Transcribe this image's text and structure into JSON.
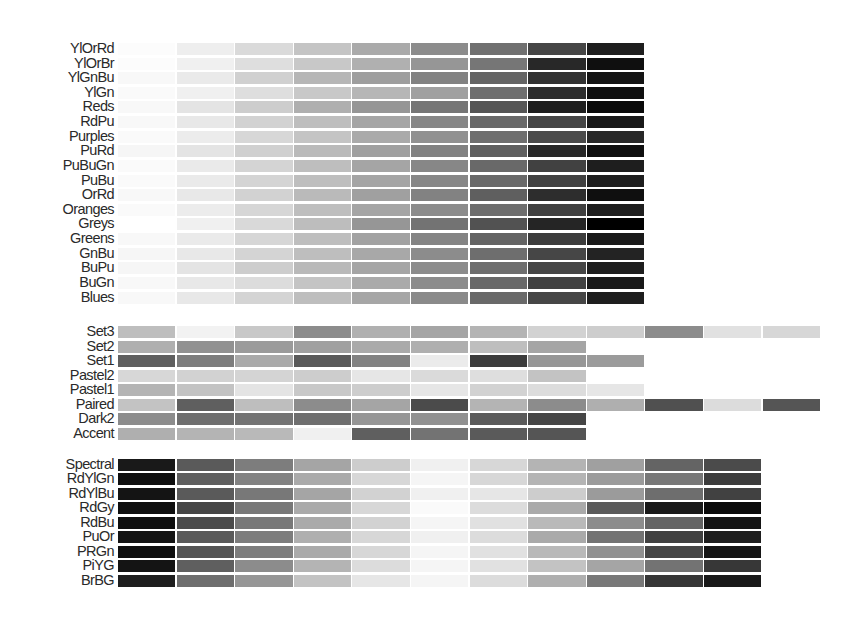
{
  "chart_data": {
    "type": "heatmap",
    "title": "",
    "grid": false,
    "groups": [
      {
        "name": "sequential",
        "n_colors": 9,
        "palettes": [
          {
            "name": "YlOrRd",
            "grays": [
              252,
              238,
              218,
              196,
              170,
              140,
              112,
              70,
              30
            ]
          },
          {
            "name": "YlOrBr",
            "grays": [
              252,
              240,
              222,
              200,
              176,
              150,
              118,
              40,
              15
            ]
          },
          {
            "name": "YlGnBu",
            "grays": [
              248,
              234,
              208,
              182,
              158,
              130,
              100,
              50,
              20
            ]
          },
          {
            "name": "YlGn",
            "grays": [
              250,
              240,
              222,
              200,
              182,
              160,
              110,
              45,
              15
            ]
          },
          {
            "name": "Reds",
            "grays": [
              248,
              228,
              205,
              175,
              150,
              118,
              85,
              30,
              10
            ]
          },
          {
            "name": "RdPu",
            "grays": [
              248,
              232,
              210,
              190,
              165,
              135,
              105,
              70,
              25
            ]
          },
          {
            "name": "Purples",
            "grays": [
              250,
              236,
              215,
              196,
              170,
              145,
              110,
              75,
              40
            ]
          },
          {
            "name": "PuRd",
            "grays": [
              246,
              228,
              208,
              186,
              160,
              130,
              95,
              40,
              15
            ]
          },
          {
            "name": "PuBuGn",
            "grays": [
              250,
              234,
              212,
              190,
              165,
              135,
              105,
              65,
              30
            ]
          },
          {
            "name": "PuBu",
            "grays": [
              250,
              234,
              212,
              190,
              165,
              135,
              105,
              65,
              30
            ]
          },
          {
            "name": "OrRd",
            "grays": [
              248,
              232,
              210,
              186,
              160,
              130,
              95,
              45,
              15
            ]
          },
          {
            "name": "Oranges",
            "grays": [
              250,
              236,
              214,
              190,
              165,
              140,
              110,
              65,
              30
            ]
          },
          {
            "name": "Greys",
            "grays": [
              255,
              240,
              217,
              189,
              150,
              115,
              82,
              37,
              0
            ]
          },
          {
            "name": "Greens",
            "grays": [
              248,
              234,
              214,
              190,
              162,
              132,
              100,
              60,
              25
            ]
          },
          {
            "name": "GnBu",
            "grays": [
              246,
              232,
              212,
              190,
              168,
              140,
              110,
              70,
              35
            ]
          },
          {
            "name": "BuPu",
            "grays": [
              246,
              228,
              205,
              185,
              165,
              140,
              110,
              70,
              30
            ]
          },
          {
            "name": "BuGn",
            "grays": [
              248,
              232,
              220,
              196,
              170,
              140,
              105,
              65,
              25
            ]
          },
          {
            "name": "Blues",
            "grays": [
              248,
              232,
              212,
              190,
              166,
              138,
              105,
              70,
              30
            ]
          }
        ]
      },
      {
        "name": "qualitative",
        "palettes": [
          {
            "name": "Set3",
            "grays": [
              190,
              242,
              200,
              140,
              176,
              165,
              180,
              210,
              205,
              140,
              225,
              215
            ]
          },
          {
            "name": "Set2",
            "grays": [
              175,
              145,
              155,
              160,
              170,
              175,
              190,
              165
            ]
          },
          {
            "name": "Set1",
            "grays": [
              95,
              125,
              170,
              90,
              130,
              235,
              60,
              150,
              155
            ]
          },
          {
            "name": "Pastel2",
            "grays": [
              215,
              210,
              212,
              205,
              230,
              218,
              222,
              195
            ]
          },
          {
            "name": "Pastel1",
            "grays": [
              180,
              195,
              228,
              200,
              205,
              230,
              210,
              220,
              230
            ]
          },
          {
            "name": "Paired",
            "grays": [
              195,
              95,
              190,
              140,
              165,
              75,
              180,
              140,
              175,
              80,
              220,
              85
            ]
          },
          {
            "name": "Dark2",
            "grays": [
              140,
              110,
              115,
              110,
              150,
              145,
              90,
              70
            ]
          },
          {
            "name": "Accent",
            "grays": [
              175,
              180,
              185,
              240,
              95,
              115,
              90,
              85
            ]
          }
        ]
      },
      {
        "name": "diverging",
        "n_colors": 11,
        "palettes": [
          {
            "name": "Spectral",
            "grays": [
              25,
              90,
              125,
              165,
              205,
              240,
              215,
              180,
              160,
              100,
              75
            ]
          },
          {
            "name": "RdYlGn",
            "grays": [
              15,
              95,
              130,
              170,
              215,
              245,
              215,
              180,
              155,
              120,
              60
            ]
          },
          {
            "name": "RdYlBu",
            "grays": [
              20,
              90,
              120,
              165,
              210,
              240,
              230,
              205,
              155,
              110,
              65
            ]
          },
          {
            "name": "RdGy",
            "grays": [
              15,
              70,
              120,
              170,
              215,
              250,
              220,
              170,
              90,
              25,
              10
            ]
          },
          {
            "name": "RdBu",
            "grays": [
              15,
              75,
              120,
              170,
              210,
              245,
              225,
              185,
              140,
              100,
              20
            ]
          },
          {
            "name": "PuOr",
            "grays": [
              20,
              90,
              125,
              175,
              215,
              240,
              220,
              170,
              115,
              65,
              30
            ]
          },
          {
            "name": "PRGn",
            "grays": [
              15,
              85,
              125,
              170,
              215,
              245,
              225,
              185,
              145,
              70,
              20
            ]
          },
          {
            "name": "PiYG",
            "grays": [
              20,
              95,
              140,
              180,
              220,
              245,
              225,
              195,
              165,
              115,
              55
            ]
          },
          {
            "name": "BrBG",
            "grays": [
              30,
              110,
              150,
              195,
              230,
              245,
              220,
              175,
              120,
              55,
              25
            ]
          }
        ]
      }
    ],
    "xlabel": "",
    "ylabel": "",
    "legend": "none"
  },
  "layout": {
    "x0": 118,
    "col_width": 58.6,
    "groups": [
      {
        "y0": 43,
        "pitch": 14.62,
        "bar_h": 12
      },
      {
        "y0": 326,
        "pitch": 14.55,
        "bar_h": 12
      },
      {
        "y0": 459,
        "pitch": 14.45,
        "bar_h": 12
      }
    ]
  }
}
